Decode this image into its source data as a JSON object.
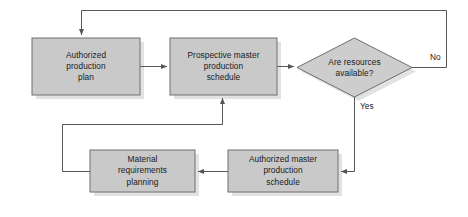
{
  "diagram": {
    "type": "flowchart",
    "colors": {
      "node_fill": "#c9c9c9",
      "node_fill_light": "#d2d2d2",
      "node_border": "#6e6e6e",
      "shadow": "#e2e2e2",
      "connector": "#55555a",
      "text": "#1a1a1a",
      "background": "#ffffff"
    },
    "nodes": [
      {
        "id": "authorized-production-plan",
        "shape": "process",
        "label": "Authorized\nproduction\nplan",
        "x": 32,
        "y": 38,
        "w": 108,
        "h": 57
      },
      {
        "id": "prospective-master-production-schedule",
        "shape": "process",
        "label": "Prospective master\nproduction\nschedule",
        "x": 170,
        "y": 38,
        "w": 107,
        "h": 57
      },
      {
        "id": "are-resources-available",
        "shape": "decision",
        "label": "Are resources\navailable?",
        "x": 297,
        "y": 38,
        "w": 115,
        "h": 59
      },
      {
        "id": "material-requirements-planning",
        "shape": "process",
        "label": "Material\nrequirements\nplanning",
        "x": 90,
        "y": 150,
        "w": 105,
        "h": 42
      },
      {
        "id": "authorized-master-production-schedule",
        "shape": "process",
        "label": "Authorized master\nproduction\nschedule",
        "x": 228,
        "y": 150,
        "w": 110,
        "h": 42
      }
    ],
    "edge_labels": [
      {
        "id": "no-branch-label",
        "text": "No",
        "x": 430,
        "y": 52
      },
      {
        "id": "yes-branch-label",
        "text": "Yes",
        "x": 360,
        "y": 101
      }
    ],
    "edges": [
      {
        "id": "plan-to-prospective",
        "from": "authorized-production-plan",
        "to": "prospective-master-production-schedule",
        "label": "",
        "arrow": true
      },
      {
        "id": "prospective-to-decision",
        "from": "prospective-master-production-schedule",
        "to": "are-resources-available",
        "label": "",
        "arrow": true
      },
      {
        "id": "decision-no-to-plan",
        "from": "are-resources-available",
        "to": "authorized-production-plan",
        "label": "No",
        "arrow": true
      },
      {
        "id": "decision-yes-to-authorized-master",
        "from": "are-resources-available",
        "to": "authorized-master-production-schedule",
        "label": "Yes",
        "arrow": true
      },
      {
        "id": "authorized-master-to-mrp",
        "from": "authorized-master-production-schedule",
        "to": "material-requirements-planning",
        "label": "",
        "arrow": true
      },
      {
        "id": "mrp-to-prospective",
        "from": "material-requirements-planning",
        "to": "prospective-master-production-schedule",
        "label": "",
        "arrow": true
      }
    ]
  }
}
